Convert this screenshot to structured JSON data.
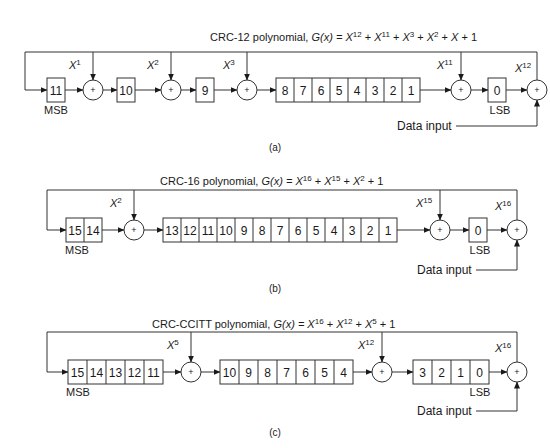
{
  "figure": {
    "panels": [
      {
        "id": "a",
        "caption": "(a)",
        "title_prefix": "CRC-12 polynomial, ",
        "title_gx": "G(x) = ",
        "polynomial_terms": [
          {
            "base": "X",
            "exp": "12"
          },
          {
            "base": "X",
            "exp": "11"
          },
          {
            "base": "X",
            "exp": "3"
          },
          {
            "base": "X",
            "exp": "2"
          },
          {
            "base": "X",
            "exp": ""
          },
          {
            "base": "1",
            "exp": ""
          }
        ],
        "register_groups": [
          [
            "11"
          ],
          [
            "10"
          ],
          [
            "9"
          ],
          [
            "8",
            "7",
            "6",
            "5",
            "4",
            "3",
            "2",
            "1"
          ],
          [
            "0"
          ]
        ],
        "taps": [
          {
            "base": "X",
            "exp": "1"
          },
          {
            "base": "X",
            "exp": "2"
          },
          {
            "base": "X",
            "exp": "3"
          },
          {
            "base": "X",
            "exp": "11"
          },
          {
            "base": "X",
            "exp": "12"
          }
        ],
        "msb_label": "MSB",
        "lsb_label": "LSB",
        "data_input_label": "Data input"
      },
      {
        "id": "b",
        "caption": "(b)",
        "title_prefix": "CRC-16 polynomial, ",
        "title_gx": "G(x) = ",
        "polynomial_terms": [
          {
            "base": "X",
            "exp": "16"
          },
          {
            "base": "X",
            "exp": "15"
          },
          {
            "base": "X",
            "exp": "2"
          },
          {
            "base": "1",
            "exp": ""
          }
        ],
        "register_groups": [
          [
            "15",
            "14"
          ],
          [
            "13",
            "12",
            "11",
            "10",
            "9",
            "8",
            "7",
            "6",
            "5",
            "4",
            "3",
            "2",
            "1"
          ],
          [
            "0"
          ]
        ],
        "taps": [
          {
            "base": "X",
            "exp": "2"
          },
          {
            "base": "X",
            "exp": "15"
          },
          {
            "base": "X",
            "exp": "16"
          }
        ],
        "msb_label": "MSB",
        "lsb_label": "LSB",
        "data_input_label": "Data input"
      },
      {
        "id": "c",
        "caption": "(c)",
        "title_prefix": "CRC-CCITT polynomial, ",
        "title_gx": "G(x) = ",
        "polynomial_terms": [
          {
            "base": "X",
            "exp": "16"
          },
          {
            "base": "X",
            "exp": "12"
          },
          {
            "base": "X",
            "exp": "5"
          },
          {
            "base": "1",
            "exp": ""
          }
        ],
        "register_groups": [
          [
            "15",
            "14",
            "13",
            "12",
            "11"
          ],
          [
            "10",
            "9",
            "8",
            "7",
            "6",
            "5",
            "4"
          ],
          [
            "3",
            "2",
            "1",
            "0"
          ]
        ],
        "taps": [
          {
            "base": "X",
            "exp": "5"
          },
          {
            "base": "X",
            "exp": "12"
          },
          {
            "base": "X",
            "exp": "16"
          }
        ],
        "msb_label": "MSB",
        "lsb_label": "LSB",
        "data_input_label": "Data input"
      }
    ],
    "xor_symbol": "+"
  }
}
